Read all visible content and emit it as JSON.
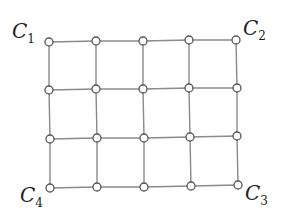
{
  "diagram": {
    "type": "grid-graph",
    "rows": 4,
    "cols": 5,
    "colors": {
      "edge": "#8a8a8a",
      "node_stroke": "#555555",
      "node_fill": "#ffffff",
      "text": "#222222"
    },
    "nodes": [
      [
        [
          49,
          42
        ],
        [
          96,
          41
        ],
        [
          143,
          41
        ],
        [
          189,
          40
        ],
        [
          236,
          40
        ]
      ],
      [
        [
          49,
          90
        ],
        [
          96,
          89
        ],
        [
          143,
          89
        ],
        [
          189,
          88
        ],
        [
          237,
          88
        ]
      ],
      [
        [
          50,
          139
        ],
        [
          97,
          138
        ],
        [
          144,
          138
        ],
        [
          190,
          137
        ],
        [
          237,
          136
        ]
      ],
      [
        [
          50,
          188
        ],
        [
          97,
          187
        ],
        [
          144,
          187
        ],
        [
          191,
          186
        ],
        [
          238,
          185
        ]
      ]
    ],
    "corner_labels": [
      {
        "id": "C1",
        "letter": "C",
        "sub": "1",
        "corner": "top-left",
        "x": 12,
        "y": 38
      },
      {
        "id": "C2",
        "letter": "C",
        "sub": "2",
        "corner": "top-right",
        "x": 243,
        "y": 35
      },
      {
        "id": "C3",
        "letter": "C",
        "sub": "3",
        "corner": "bottom-right",
        "x": 245,
        "y": 200
      },
      {
        "id": "C4",
        "letter": "C",
        "sub": "4",
        "corner": "bottom-left",
        "x": 20,
        "y": 202
      }
    ]
  }
}
